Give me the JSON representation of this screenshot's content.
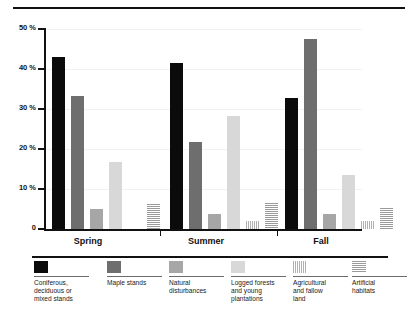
{
  "figure": {
    "top_rule": "divider",
    "background_color": "#ffffff"
  },
  "axis": {
    "y_ticks": [
      "50 %",
      "40 %",
      "30 %",
      "20 %",
      "10 %",
      "0"
    ],
    "y_values": [
      50,
      40,
      30,
      20,
      10,
      0
    ]
  },
  "categories": [
    "Spring",
    "Summer",
    "Fall"
  ],
  "legend": {
    "items": [
      {
        "label": "Coniferous,\ndeciduous or\nmixed stands",
        "swatch": "solid-black",
        "color": "#0b0b0b"
      },
      {
        "label": "Maple stands",
        "swatch": "solid-dark",
        "color": "#6e6e6e"
      },
      {
        "label": "Natural\ndisturbances",
        "swatch": "solid-medium",
        "color": "#a6a6a6"
      },
      {
        "label": "Logged forests\nand young\nplantations",
        "swatch": "solid-light",
        "color": "#d8d8d8"
      },
      {
        "label": "Agricultural\nand fallow\nland",
        "swatch": "vertical-stripes",
        "color": "#b0b0b0"
      },
      {
        "label": "Artificial\nhabitats",
        "swatch": "horizontal-stripes",
        "color": "#9a9a9a"
      }
    ]
  },
  "chart_data": {
    "type": "bar",
    "title": "",
    "xlabel": "",
    "ylabel": "",
    "ylim": [
      0,
      50
    ],
    "yticks": [
      0,
      10,
      20,
      30,
      40,
      50
    ],
    "ytick_labels": [
      "0",
      "10 %",
      "20 %",
      "30 %",
      "40 %",
      "50 %"
    ],
    "grid": true,
    "legend_position": "bottom",
    "categories": [
      "Spring",
      "Summer",
      "Fall"
    ],
    "series": [
      {
        "name": "Coniferous, deciduous or mixed stands",
        "color": "#0b0b0b",
        "pattern": "solid",
        "values": [
          43.0,
          41.5,
          32.7
        ]
      },
      {
        "name": "Maple stands",
        "color": "#6e6e6e",
        "pattern": "solid",
        "values": [
          33.3,
          21.7,
          47.4
        ]
      },
      {
        "name": "Natural disturbances",
        "color": "#a6a6a6",
        "pattern": "solid",
        "values": [
          5.1,
          3.7,
          3.8
        ]
      },
      {
        "name": "Logged forests and young plantations",
        "color": "#d8d8d8",
        "pattern": "solid",
        "values": [
          16.8,
          28.2,
          13.5
        ]
      },
      {
        "name": "Agricultural and fallow land",
        "color": "#b0b0b0",
        "pattern": "vertical-stripes",
        "values": [
          0.0,
          2.1,
          2.1
        ]
      },
      {
        "name": "Artificial habitats",
        "color": "#9a9a9a",
        "pattern": "horizontal-stripes",
        "values": [
          6.3,
          6.5,
          5.3
        ]
      }
    ]
  }
}
